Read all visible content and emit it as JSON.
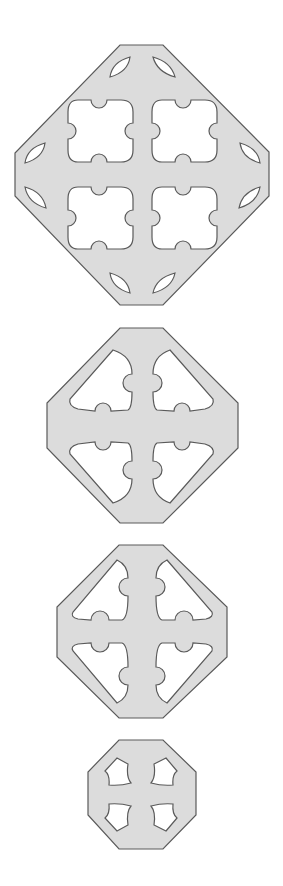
{
  "figure": {
    "colors": {
      "fill": "#dcdcdc",
      "stroke": "#5a5a5a",
      "background": "#ffffff",
      "cutout": "#ffffff"
    },
    "plates": [
      {
        "id": "plate-1",
        "label": "",
        "cutouts": "4 square holes with semicircular notches, 8 leaf-shaped corner slots"
      },
      {
        "id": "plate-2",
        "label": "",
        "cutouts": "4 corner cutouts with notches, cross-shaped bar"
      },
      {
        "id": "plate-3",
        "label": "",
        "cutouts": "4 corner cutouts with notches, cross-shaped bar"
      },
      {
        "id": "plate-4",
        "label": "",
        "cutouts": "4 curved quadrilateral holes"
      }
    ]
  }
}
